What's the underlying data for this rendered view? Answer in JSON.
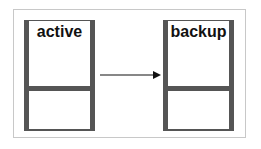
{
  "diagram": {
    "nodes": [
      {
        "id": "active",
        "label": "active"
      },
      {
        "id": "backup",
        "label": "backup"
      }
    ],
    "edges": [
      {
        "from": "active",
        "to": "backup",
        "style": "arrow"
      }
    ],
    "colors": {
      "container_border": "#555555",
      "frame_border": "#c8c8c8",
      "text": "#111111"
    }
  }
}
